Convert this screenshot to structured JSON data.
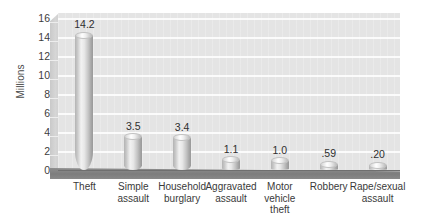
{
  "chart_data": {
    "type": "bar",
    "title": "",
    "subtitle": "",
    "xlabel": "",
    "ylabel": "Millions",
    "ylim": [
      0,
      16
    ],
    "grid": true,
    "legend": "none",
    "style": "3d-cylinder",
    "categories": [
      "Theft",
      "Simple assault",
      "Household burglary",
      "Aggravated assault",
      "Motor vehicle theft",
      "Robbery",
      "Rape/sexual assault"
    ],
    "category_lines": [
      [
        "Theft"
      ],
      [
        "Simple",
        "assault"
      ],
      [
        "Household",
        "burglary"
      ],
      [
        "Aggravated",
        "assault"
      ],
      [
        "Motor",
        "vehicle",
        "theft"
      ],
      [
        "Robbery"
      ],
      [
        "Rape/sexual",
        "assault"
      ]
    ],
    "values": [
      14.2,
      3.5,
      3.4,
      1.1,
      1.0,
      0.59,
      0.2
    ],
    "value_labels": [
      "14.2",
      "3.5",
      "3.4",
      "1.1",
      "1.0",
      ".59",
      ".20"
    ],
    "yticks": [
      0,
      2,
      4,
      6,
      8,
      10,
      12,
      14,
      16
    ],
    "ytick_labels": [
      "0",
      "2",
      "4",
      "6",
      "8",
      "10",
      "12",
      "14",
      "16"
    ]
  },
  "colors": {
    "plot_background": "#e4e4e4",
    "gridline": "#fbfbfb",
    "floor": "#7d7d7d",
    "side_wall": "#cfcfcf",
    "bar_light": "#f2f2f2",
    "bar_dark": "#999999",
    "text": "#3a3a3a",
    "page_background": "#ffffff"
  }
}
